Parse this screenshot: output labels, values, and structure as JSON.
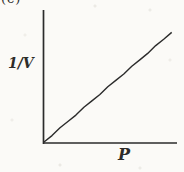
{
  "figure": {
    "panel_label": "(c)",
    "ylabel": "1/V",
    "xlabel": "P"
  },
  "colors": {
    "ink": "#2b2b2b",
    "label": "#2e2c29",
    "paper": "#fbfaf7"
  },
  "chart_data": {
    "type": "line",
    "title": "",
    "panel_label": "(c)",
    "xlabel": "P",
    "ylabel": "1/V",
    "xlim": [
      0,
      1
    ],
    "ylim": [
      0,
      1
    ],
    "grid": false,
    "axis_ticks": "none",
    "legend": "none",
    "series": [
      {
        "name": "1/V vs P",
        "x": [
          0,
          0.96
        ],
        "values": [
          0,
          0.83
        ]
      }
    ]
  }
}
